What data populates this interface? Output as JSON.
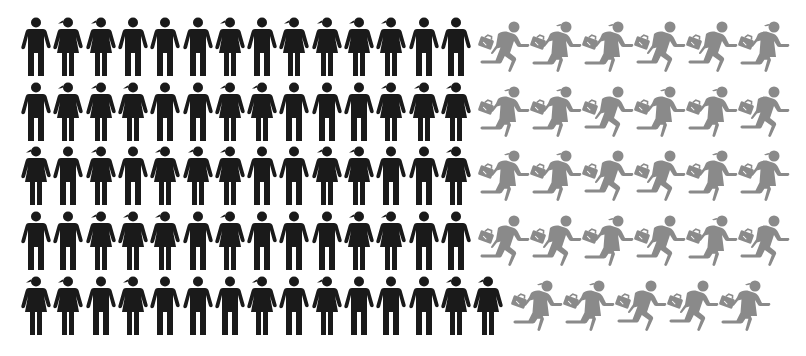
{
  "colors": {
    "background": "#ffffff",
    "standing": "#1a1a1a",
    "running": "#8a8a8a"
  },
  "icons": {
    "standing_male": "person-standing-male-icon",
    "standing_female": "person-standing-female-icon",
    "running_male": "person-running-briefcase-male-icon",
    "running_female": "person-running-briefcase-female-icon"
  },
  "rows": [
    {
      "standing": [
        "M",
        "F",
        "F",
        "M",
        "M",
        "M",
        "F",
        "M",
        "F",
        "F",
        "F",
        "F",
        "M",
        "M"
      ],
      "running": [
        "M",
        "F",
        "F",
        "M",
        "M",
        "F"
      ]
    },
    {
      "standing": [
        "M",
        "F",
        "F",
        "F",
        "M",
        "M",
        "F",
        "F",
        "M",
        "M",
        "M",
        "F",
        "F",
        "F"
      ],
      "running": [
        "F",
        "F",
        "M",
        "F",
        "F",
        "M"
      ]
    },
    {
      "standing": [
        "F",
        "M",
        "F",
        "M",
        "F",
        "F",
        "F",
        "M",
        "M",
        "F",
        "F",
        "M",
        "M",
        "F"
      ],
      "running": [
        "F",
        "F",
        "M",
        "M",
        "F",
        "F"
      ]
    },
    {
      "standing": [
        "M",
        "M",
        "F",
        "F",
        "F",
        "M",
        "F",
        "M",
        "M",
        "M",
        "F",
        "F",
        "M",
        "M"
      ],
      "running": [
        "M",
        "M",
        "F",
        "M",
        "F",
        "M"
      ]
    },
    {
      "standing": [
        "F",
        "F",
        "M",
        "F",
        "M",
        "M",
        "M",
        "F",
        "M",
        "F",
        "M",
        "M",
        "M",
        "F",
        "F"
      ],
      "running": [
        "F",
        "F",
        "M",
        "M",
        "F"
      ]
    }
  ],
  "totals": {
    "standing": 71,
    "running": 29,
    "all": 100
  }
}
